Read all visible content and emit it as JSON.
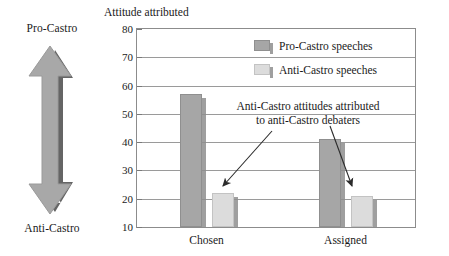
{
  "scale": {
    "top_label": "Pro-Castro",
    "bottom_label": "Anti-Castro",
    "arrow_icon": "double-headed-vertical-arrow"
  },
  "chart_data": {
    "type": "bar",
    "title": "Attitude attributed",
    "xlabel": "",
    "ylabel": "",
    "ylim": [
      10,
      80
    ],
    "yticks": [
      10,
      20,
      30,
      40,
      50,
      60,
      70,
      80
    ],
    "grid": true,
    "legend_position": "top-right-inside",
    "categories": [
      "Chosen",
      "Assigned"
    ],
    "series": [
      {
        "name": "Pro-Castro speeches",
        "values": [
          57,
          41
        ],
        "color": "#a6a6a6"
      },
      {
        "name": "Anti-Castro speeches",
        "values": [
          22,
          21
        ],
        "color": "#dcdcdc"
      }
    ],
    "annotations": [
      {
        "text_line1": "Anti-Castro attitudes attributed",
        "text_line2": "to anti-Castro debaters",
        "points_to": [
          "Chosen / Anti-Castro speeches",
          "Assigned / Anti-Castro speeches"
        ]
      }
    ]
  }
}
